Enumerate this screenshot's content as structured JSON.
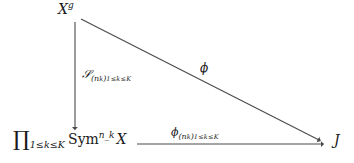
{
  "diagram": {
    "kind": "commutative-triangle",
    "background_color": "#ffffff",
    "stroke_color": "#4a4a4a",
    "text_color": "#1a1a1a",
    "nodes": [
      {
        "id": "top-left",
        "position": "top-left",
        "text": "X^g",
        "base": "X",
        "superscript": "g"
      },
      {
        "id": "bottom-left",
        "position": "bottom-left",
        "text": "∏_{1≤k≤K} Sym^{n_k} X",
        "bigop": "∏",
        "range": "1≤k≤K",
        "functor": "Sym",
        "functor_superscript": "n_k",
        "operand": "X"
      },
      {
        "id": "bottom-right",
        "position": "bottom-right",
        "text": "J"
      }
    ],
    "arrows": [
      {
        "id": "vertical",
        "from": "top-left",
        "to": "bottom-left",
        "direction": "down",
        "label": "𝒮_{(n_k)_{1≤k≤K}}",
        "label_symbol": "𝒮",
        "label_sub_open": "(n",
        "label_sub_k": "k",
        "label_sub_close": ")",
        "label_sub_range": "1≤k≤K"
      },
      {
        "id": "diagonal",
        "from": "top-left",
        "to": "bottom-right",
        "direction": "down-right",
        "label": "ϕ"
      },
      {
        "id": "horizontal",
        "from": "bottom-left",
        "to": "bottom-right",
        "direction": "right",
        "label": "ϕ_{(n_k)_{1≤k≤K}}",
        "label_symbol": "ϕ",
        "label_sub_open": "(n",
        "label_sub_k": "k",
        "label_sub_close": ")",
        "label_sub_range": "1≤k≤K"
      }
    ]
  }
}
